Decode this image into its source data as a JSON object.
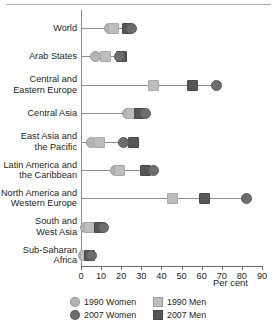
{
  "chart_data": {
    "type": "scatter",
    "title": "",
    "subtitle": "",
    "xlabel": "Per cent",
    "ylabel": "",
    "xlim": [
      0,
      90
    ],
    "xticks": [
      0,
      10,
      20,
      30,
      40,
      50,
      60,
      70,
      80,
      90
    ],
    "grid": false,
    "legend_position": "bottom",
    "categories": [
      "World",
      "Arab States",
      "Central and\nEastern Europe",
      "Central Asia",
      "East Asia and\nthe Pacific",
      "Latin America and\nthe Caribbean",
      "North America and\nWestern Europe",
      "South and\nWest Asia",
      "Sub-Saharan\nAfrica"
    ],
    "series": [
      {
        "name": "1990 Women",
        "marker": "circle",
        "color": "#b3b3b3",
        "values": [
          14,
          7,
          36,
          23,
          5,
          17,
          45,
          2,
          1
        ]
      },
      {
        "name": "1990 Men",
        "marker": "square",
        "color": "#bdbdbd",
        "values": [
          16,
          12,
          36,
          25,
          9,
          19,
          45,
          4,
          2
        ]
      },
      {
        "name": "2007 Women",
        "marker": "circle",
        "color": "#6d6d6d",
        "values": [
          25,
          19,
          67,
          32,
          21,
          36,
          82,
          11,
          5
        ]
      },
      {
        "name": "2007 Men",
        "marker": "square",
        "color": "#565656",
        "values": [
          23,
          20,
          55,
          29,
          26,
          32,
          61,
          9,
          4
        ]
      }
    ]
  },
  "legend": {
    "items": [
      {
        "label": "1990 Women",
        "marker": "circle",
        "color": "#b3b3b3"
      },
      {
        "label": "1990 Men",
        "marker": "square",
        "color": "#bdbdbd"
      },
      {
        "label": "2007 Women",
        "marker": "circle",
        "color": "#6d6d6d"
      },
      {
        "label": "2007 Men",
        "marker": "square",
        "color": "#565656"
      }
    ]
  }
}
